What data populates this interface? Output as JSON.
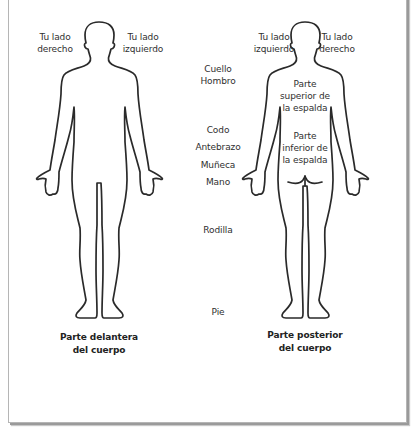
{
  "front": {
    "right_side_label": [
      "Tu lado",
      "derecho"
    ],
    "left_side_label": [
      "Tu lado",
      "izquierdo"
    ],
    "caption": [
      "Parte delantera",
      "del cuerpo"
    ]
  },
  "back": {
    "left_side_label": [
      "Tu lado",
      "izquierdo"
    ],
    "right_side_label": [
      "Tu lado",
      "derecho"
    ],
    "upper_back": [
      "Parte",
      "superior de",
      "la espalda"
    ],
    "lower_back": [
      "Parte",
      "inferior de",
      "la espalda"
    ],
    "caption": [
      "Parte posterior",
      "del cuerpo"
    ]
  },
  "body_parts": {
    "neck": "Cuello",
    "shoulder": "Hombro",
    "elbow": "Codo",
    "forearm": "Antebrazo",
    "wrist": "Muñeca",
    "hand": "Mano",
    "knee": "Rodilla",
    "foot": "Pie"
  },
  "colors": {
    "outline": "#2a2a2a",
    "text": "#2f2f2f",
    "frame_border": "#b5b5b5",
    "frame_shadow": "#9a9a9a"
  }
}
